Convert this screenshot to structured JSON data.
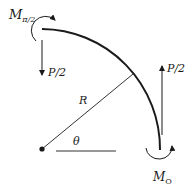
{
  "diagram": {
    "labels": {
      "moment_top": "M",
      "moment_top_sub": "π/2",
      "force_left": "P/2",
      "force_right": "P/2",
      "radius": "R",
      "angle": "θ",
      "moment_bottom": "M",
      "moment_bottom_sub": "O"
    },
    "colors": {
      "stroke": "#1a1a1a",
      "background": "#ffffff"
    }
  }
}
